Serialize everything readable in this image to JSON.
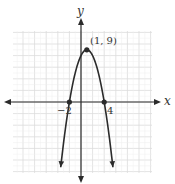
{
  "chart_data": {
    "type": "line",
    "title": "",
    "function": "y = -(x-1)^2 + 9",
    "xlabel": "x",
    "ylabel": "y",
    "xlim": [
      -12,
      12
    ],
    "ylim": [
      -12,
      12
    ],
    "grid": true,
    "grid_step": 2,
    "points": [
      {
        "x": 1,
        "y": 9,
        "label": "(1, 9)",
        "role": "vertex"
      },
      {
        "x": -2,
        "y": 0,
        "label": "-2",
        "role": "x-intercept"
      },
      {
        "x": 4,
        "y": 0,
        "label": "4",
        "role": "x-intercept"
      }
    ],
    "curve_domain": [
      -3.5,
      5.5
    ],
    "series": [
      {
        "name": "parabola",
        "x": [
          -3.5,
          -2,
          -1,
          0,
          1,
          2,
          3,
          4,
          5.5
        ],
        "values": [
          -11.25,
          0,
          5,
          8,
          9,
          8,
          5,
          0,
          -11.25
        ]
      }
    ]
  },
  "labels": {
    "x_axis": "x",
    "y_axis": "y",
    "vertex": "(1, 9)",
    "intercept_left": "−2",
    "intercept_right": "4"
  },
  "colors": {
    "curve": "#2b2b2b",
    "axis": "#2b2b2b",
    "grid": "#dcdcdc",
    "background": "#ffffff"
  }
}
